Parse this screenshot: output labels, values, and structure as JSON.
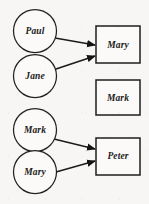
{
  "diagram": {
    "type": "bipartite-mapping",
    "canvas": {
      "width": 149,
      "height": 204,
      "background": "#f7f6f4"
    },
    "colors": {
      "stroke": "#1b1b1b",
      "node_fill": "#fbfaf8",
      "text": "#1b1b1b"
    },
    "source_nodes": [
      {
        "id": "src-paul",
        "label": "Paul",
        "shape": "circle",
        "cx": 35,
        "cy": 31,
        "r": 21.5
      },
      {
        "id": "src-jane",
        "label": "Jane",
        "shape": "circle",
        "cx": 35,
        "cy": 76,
        "r": 21.5
      },
      {
        "id": "src-mark",
        "label": "Mark",
        "shape": "circle",
        "cx": 35,
        "cy": 130,
        "r": 21.5
      },
      {
        "id": "src-mary",
        "label": "Mary",
        "shape": "circle",
        "cx": 35,
        "cy": 172,
        "r": 21.5
      }
    ],
    "target_nodes": [
      {
        "id": "tgt-mary",
        "label": "Mary",
        "shape": "rect",
        "x": 96,
        "y": 26,
        "w": 44,
        "h": 37
      },
      {
        "id": "tgt-mark",
        "label": "Mark",
        "shape": "rect",
        "x": 96,
        "y": 80,
        "w": 44,
        "h": 35
      },
      {
        "id": "tgt-peter",
        "label": "Peter",
        "shape": "rect",
        "x": 96,
        "y": 138,
        "w": 44,
        "h": 37
      }
    ],
    "edges": [
      {
        "id": "edge-paul-mary",
        "from": "src-paul",
        "to": "tgt-mary",
        "x1": 55,
        "y1": 38,
        "x2": 95,
        "y2": 45,
        "arrow": true
      },
      {
        "id": "edge-jane-mary",
        "from": "src-jane",
        "to": "tgt-mary",
        "x1": 53,
        "y1": 70,
        "x2": 95,
        "y2": 56,
        "arrow": true
      },
      {
        "id": "edge-mark-peter",
        "from": "src-mark",
        "to": "tgt-peter",
        "x1": 54,
        "y1": 139,
        "x2": 95,
        "y2": 149,
        "arrow": true
      },
      {
        "id": "edge-mary-peter",
        "from": "src-mary",
        "to": "tgt-peter",
        "x1": 56,
        "y1": 172,
        "x2": 95,
        "y2": 161,
        "arrow": true
      }
    ]
  }
}
